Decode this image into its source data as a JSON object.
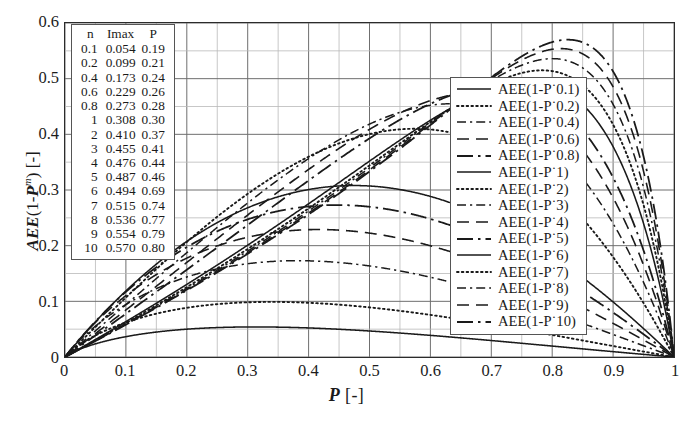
{
  "chart_data": {
    "type": "line",
    "title": "",
    "xlabel": "P  [-]",
    "ylabel": "AEE(1-P^m) [-]",
    "xlim": [
      0,
      1
    ],
    "ylim": [
      0,
      0.6
    ],
    "grid": true,
    "legend_position": "center-right",
    "xticks": [
      "0",
      "0.1",
      "0.2",
      "0.3",
      "0.4",
      "0.5",
      "0.6",
      "0.7",
      "0.8",
      "0.9",
      "1"
    ],
    "xtick_values": [
      0,
      0.1,
      0.2,
      0.3,
      0.4,
      0.5,
      0.6,
      0.7,
      0.8,
      0.9,
      1
    ],
    "yticks": [
      "0",
      "0.1",
      "0.2",
      "0.3",
      "0.4",
      "0.5",
      "0.6"
    ],
    "ytick_values": [
      0,
      0.1,
      0.2,
      0.3,
      0.4,
      0.5,
      0.6
    ],
    "x_minor_step": 0.05,
    "y_minor_step": 0.05,
    "series": [
      {
        "name": "AEE(1-P^0.1)",
        "m": 0.1,
        "style": "solid",
        "imax": 0.054,
        "p_at_imax": 0.19
      },
      {
        "name": "AEE(1-P^0.2)",
        "m": 0.2,
        "style": "dotted",
        "imax": 0.099,
        "p_at_imax": 0.21
      },
      {
        "name": "AEE(1-P^0.4)",
        "m": 0.4,
        "style": "dashdot",
        "imax": 0.173,
        "p_at_imax": 0.24
      },
      {
        "name": "AEE(1-P^0.6)",
        "m": 0.6,
        "style": "dashed",
        "imax": 0.229,
        "p_at_imax": 0.26
      },
      {
        "name": "AEE(1-P^0.8)",
        "m": 0.8,
        "style": "longdashdot",
        "imax": 0.273,
        "p_at_imax": 0.28
      },
      {
        "name": "AEE(1-P^1)",
        "m": 1,
        "style": "solid",
        "imax": 0.308,
        "p_at_imax": 0.3
      },
      {
        "name": "AEE(1-P^2)",
        "m": 2,
        "style": "dotted",
        "imax": 0.41,
        "p_at_imax": 0.37
      },
      {
        "name": "AEE(1-P^3)",
        "m": 3,
        "style": "dashdot",
        "imax": 0.455,
        "p_at_imax": 0.41
      },
      {
        "name": "AEE(1-P^4)",
        "m": 4,
        "style": "dashed",
        "imax": 0.476,
        "p_at_imax": 0.44
      },
      {
        "name": "AEE(1-P^5)",
        "m": 5,
        "style": "longdashdot",
        "imax": 0.487,
        "p_at_imax": 0.46
      },
      {
        "name": "AEE(1-P^6)",
        "m": 6,
        "style": "solid",
        "imax": 0.494,
        "p_at_imax": 0.69
      },
      {
        "name": "AEE(1-P^7)",
        "m": 7,
        "style": "dotted",
        "imax": 0.515,
        "p_at_imax": 0.74
      },
      {
        "name": "AEE(1-P^8)",
        "m": 8,
        "style": "dashdot",
        "imax": 0.536,
        "p_at_imax": 0.77
      },
      {
        "name": "AEE(1-P^9)",
        "m": 9,
        "style": "dashed",
        "imax": 0.554,
        "p_at_imax": 0.79
      },
      {
        "name": "AEE(1-P^10)",
        "m": 10,
        "style": "longdashdot",
        "imax": 0.57,
        "p_at_imax": 0.8
      }
    ]
  },
  "axes": {
    "x_title_symbol": "P",
    "x_title_unit": "[-]",
    "y_title_prefix": "AEE",
    "y_title_body_open": "(1-",
    "y_title_var": "P",
    "y_title_exp": "m",
    "y_title_body_close": ")",
    "y_title_unit": "[-]"
  },
  "data_table": {
    "headers": [
      "n",
      "Imax",
      "P"
    ],
    "rows": [
      [
        "0.1",
        "0.054",
        "0.19"
      ],
      [
        "0.2",
        "0.099",
        "0.21"
      ],
      [
        "0.4",
        "0.173",
        "0.24"
      ],
      [
        "0.6",
        "0.229",
        "0.26"
      ],
      [
        "0.8",
        "0.273",
        "0.28"
      ],
      [
        "1",
        "0.308",
        "0.30"
      ],
      [
        "2",
        "0.410",
        "0.37"
      ],
      [
        "3",
        "0.455",
        "0.41"
      ],
      [
        "4",
        "0.476",
        "0.44"
      ],
      [
        "5",
        "0.487",
        "0.46"
      ],
      [
        "6",
        "0.494",
        "0.69"
      ],
      [
        "7",
        "0.515",
        "0.74"
      ],
      [
        "8",
        "0.536",
        "0.77"
      ],
      [
        "9",
        "0.554",
        "0.79"
      ],
      [
        "10",
        "0.570",
        "0.80"
      ]
    ]
  },
  "legend": {
    "entries": [
      {
        "label": "AEE(1-P˙0.1)",
        "style": "solid"
      },
      {
        "label": "AEE(1-P˙0.2)",
        "style": "dotted"
      },
      {
        "label": "AEE(1-P˙0.4)",
        "style": "dashdot"
      },
      {
        "label": "AEE(1-P˙0.6)",
        "style": "dashed"
      },
      {
        "label": "AEE(1-P˙0.8)",
        "style": "longdashdot"
      },
      {
        "label": "AEE(1-P˙1)",
        "style": "solid"
      },
      {
        "label": "AEE(1-P˙2)",
        "style": "dotted"
      },
      {
        "label": "AEE(1-P˙3)",
        "style": "dashdot"
      },
      {
        "label": "AEE(1-P˙4)",
        "style": "dashed"
      },
      {
        "label": "AEE(1-P˙5)",
        "style": "longdashdot"
      },
      {
        "label": "AEE(1-P˙6)",
        "style": "solid"
      },
      {
        "label": "AEE(1-P˙7)",
        "style": "dotted"
      },
      {
        "label": "AEE(1-P˙8)",
        "style": "dashdot"
      },
      {
        "label": "AEE(1-P˙9)",
        "style": "dashed"
      },
      {
        "label": "AEE(1-P˙10)",
        "style": "longdashdot"
      }
    ]
  },
  "colors": {
    "curve": "#1a1a1a",
    "axis": "#2b2b2b",
    "grid_major": "#6e6e6e",
    "grid_minor": "#b8b8b8",
    "text": "#1c1c1c"
  },
  "caption": ""
}
